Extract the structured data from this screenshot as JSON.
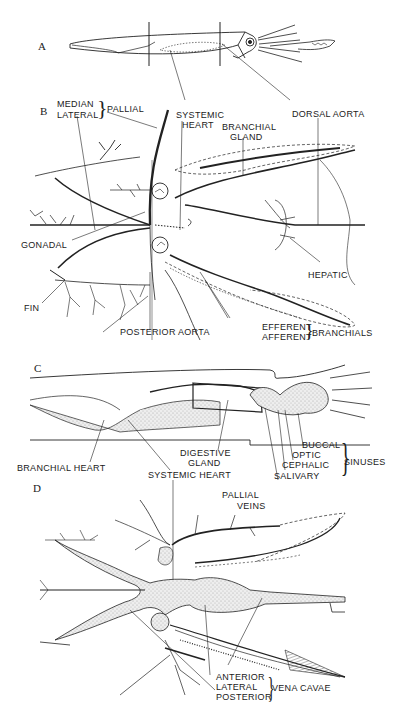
{
  "figure": {
    "panels": [
      {
        "id": "A",
        "label": "A"
      },
      {
        "id": "B",
        "label": "B"
      },
      {
        "id": "C",
        "label": "C"
      },
      {
        "id": "D",
        "label": "D"
      }
    ]
  },
  "panel_a": {
    "label": "A"
  },
  "panel_b": {
    "label": "B",
    "pallial_group": {
      "items": [
        "MEDIAN",
        "LATERAL"
      ],
      "group_label": "PALLIAL"
    },
    "systemic_heart": [
      "SYSTEMIC",
      "HEART"
    ],
    "branchial_gland": [
      "BRANCHIAL",
      "GLAND"
    ],
    "dorsal_aorta": "DORSAL AORTA",
    "gonadal": "GONADAL",
    "hepatic": "HEPATIC",
    "fin": "FIN",
    "posterior_aorta": "POSTERIOR AORTA",
    "branchials_group": {
      "items": [
        "EFFERENT",
        "AFFERENT"
      ],
      "group_label": "BRANCHIALS"
    }
  },
  "panel_c": {
    "label": "C",
    "branchial_heart": "BRANCHIAL HEART",
    "systemic_heart": "SYSTEMIC HEART",
    "digestive_gland": [
      "DIGESTIVE",
      "GLAND"
    ],
    "sinuses_group": {
      "items": [
        "BUCCAL",
        "OPTIC",
        "CEPHALIC",
        "SALIVARY"
      ],
      "group_label": "SINUSES"
    }
  },
  "panel_d": {
    "label": "D",
    "pallial_veins": [
      "PALLIAL",
      "VEINS"
    ],
    "vena_cavae_group": {
      "items": [
        "ANTERIOR",
        "LATERAL",
        "POSTERIOR"
      ],
      "group_label": "VENA CAVAE"
    }
  }
}
